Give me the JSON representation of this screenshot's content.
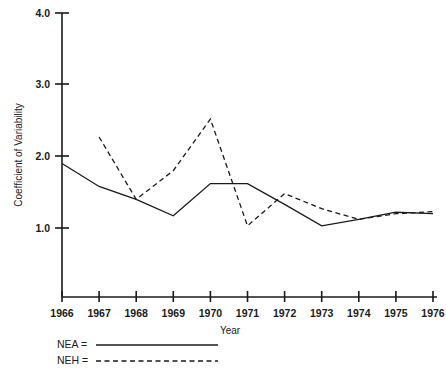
{
  "chart_data": {
    "type": "line",
    "title": "",
    "xlabel": "Year",
    "ylabel": "Coefficient of Variability",
    "x": [
      1966,
      1967,
      1968,
      1969,
      1970,
      1971,
      1972,
      1973,
      1974,
      1975,
      1976
    ],
    "xticklabels": [
      "1966",
      "1967",
      "1968",
      "1969",
      "1970",
      "1971",
      "1972",
      "1973",
      "1974",
      "1975",
      "1976"
    ],
    "yticklabels": [
      "1.0",
      "2.0",
      "3.0",
      "4.0"
    ],
    "yticks": [
      1.0,
      2.0,
      3.0,
      4.0
    ],
    "xlim": [
      1966,
      1976
    ],
    "ylim": [
      0.0,
      4.0
    ],
    "grid": false,
    "legend_position": "below-axes-left",
    "series": [
      {
        "name": "NEA",
        "style": "solid",
        "color": "#1a1a1a",
        "x": [
          1966,
          1967,
          1968,
          1969,
          1970,
          1971,
          1972,
          1973,
          1974,
          1975,
          1976
        ],
        "values": [
          1.9,
          1.58,
          1.4,
          1.17,
          1.62,
          1.62,
          1.33,
          1.03,
          1.12,
          1.22,
          1.2
        ]
      },
      {
        "name": "NEH",
        "style": "dashed",
        "color": "#1a1a1a",
        "x": [
          1967,
          1968,
          1969,
          1970,
          1971,
          1972,
          1973,
          1974,
          1975,
          1976
        ],
        "values": [
          2.27,
          1.4,
          1.8,
          2.52,
          1.03,
          1.48,
          1.27,
          1.12,
          1.2,
          1.23
        ]
      }
    ]
  },
  "axes": {
    "y_axis_label": "Coefficient of Variability",
    "x_axis_label": "Year"
  },
  "legend": {
    "entries": [
      {
        "label": "NEA  =",
        "style": "solid"
      },
      {
        "label": "NEH  =",
        "style": "dashed"
      }
    ]
  }
}
